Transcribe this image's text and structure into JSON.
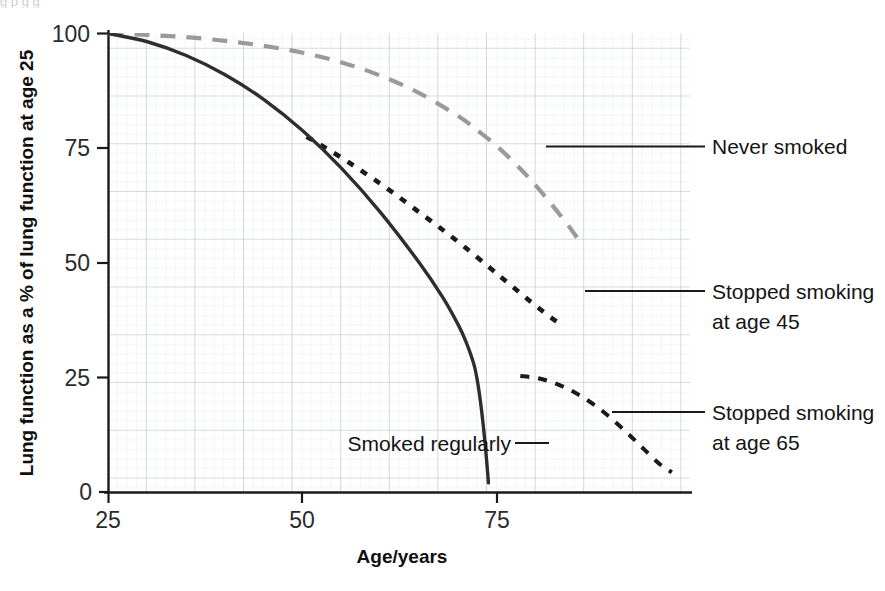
{
  "chart_data": {
    "type": "line",
    "title": "",
    "subtitle": "",
    "xlabel": "Age/years",
    "ylabel": "Lung function as a % of lung function at age 25",
    "xlim": [
      25,
      88
    ],
    "ylim": [
      0,
      100
    ],
    "xticks": [
      25,
      50,
      75
    ],
    "yticks": [
      0,
      25,
      50,
      75,
      100
    ],
    "xtick_labels": [
      "25",
      "50",
      "75"
    ],
    "ytick_labels": [
      "0",
      "25",
      "50",
      "75",
      "100"
    ],
    "grid": "fine graph paper grid, minor cells with major lines every 5 cells",
    "legend_position": "right, leader lines to curve ends",
    "series": [
      {
        "name": "Never smoked",
        "style": "dashed",
        "color": "#9a9a9a",
        "label_x": 710,
        "label_y": 152,
        "points": [
          [
            25,
            100
          ],
          [
            30,
            99.7
          ],
          [
            35,
            99.2
          ],
          [
            40,
            98.4
          ],
          [
            45,
            97.3
          ],
          [
            50,
            95.8
          ],
          [
            55,
            93.7
          ],
          [
            60,
            90.8
          ],
          [
            65,
            87.0
          ],
          [
            70,
            82.0
          ],
          [
            72,
            79.5
          ],
          [
            75,
            75.4
          ],
          [
            78,
            70.5
          ],
          [
            80,
            66.8
          ],
          [
            82,
            62.8
          ],
          [
            84,
            58.5
          ],
          [
            85,
            56.2
          ],
          [
            85.5,
            55.0
          ]
        ]
      },
      {
        "name": "Stopped smoking at age 45",
        "style": "dotted",
        "color": "#1a1a1a",
        "label_x": 710,
        "label_y": 296,
        "points": [
          [
            50.5,
            77.5
          ],
          [
            53,
            75.0
          ],
          [
            56,
            71.8
          ],
          [
            59,
            68.4
          ],
          [
            62,
            64.8
          ],
          [
            65,
            61.0
          ],
          [
            68,
            57.2
          ],
          [
            71,
            53.2
          ],
          [
            74,
            49.0
          ],
          [
            76,
            46.2
          ],
          [
            78,
            43.4
          ],
          [
            80,
            40.6
          ],
          [
            82,
            38.0
          ],
          [
            83.5,
            36.3
          ]
        ]
      },
      {
        "name": "Stopped smoking at age 65",
        "style": "dotted",
        "color": "#1a1a1a",
        "label_x": 710,
        "label_y": 417,
        "points": [
          [
            78,
            25.3
          ],
          [
            80,
            24.9
          ],
          [
            82,
            24.0
          ],
          [
            84,
            22.6
          ],
          [
            86,
            20.7
          ],
          [
            88,
            18.4
          ],
          [
            90,
            15.6
          ],
          [
            92,
            12.5
          ],
          [
            94,
            9.2
          ],
          [
            96,
            6.0
          ],
          [
            97.5,
            4.3
          ]
        ]
      },
      {
        "name": "Smoked regularly",
        "style": "solid",
        "color": "#2e2e2e",
        "label_x": 345,
        "label_y": 438,
        "points": [
          [
            25,
            100
          ],
          [
            30,
            98.2
          ],
          [
            35,
            95.2
          ],
          [
            40,
            91.0
          ],
          [
            45,
            85.6
          ],
          [
            50,
            78.8
          ],
          [
            55,
            70.6
          ],
          [
            60,
            61.0
          ],
          [
            65,
            50.0
          ],
          [
            68,
            42.5
          ],
          [
            70,
            36.5
          ],
          [
            71,
            32.8
          ],
          [
            72,
            28.0
          ],
          [
            72.5,
            24.0
          ],
          [
            73,
            18.0
          ],
          [
            73.5,
            10.0
          ],
          [
            73.9,
            2.0
          ]
        ]
      }
    ],
    "annotations": [
      {
        "text": "Never smoked",
        "target_series": "Never smoked"
      },
      {
        "text": "Stopped smoking",
        "text2": "at age 45",
        "target_series": "Stopped smoking at age 45"
      },
      {
        "text": "Stopped smoking",
        "text2": "at age 65",
        "target_series": "Stopped smoking at age 65"
      },
      {
        "text": "Smoked regularly",
        "target_series": "Smoked regularly"
      }
    ]
  },
  "axes": {
    "y_title": "Lung function as a % of lung function at age 25",
    "x_title": "Age/years",
    "y_tick_0": "0",
    "y_tick_25": "25",
    "y_tick_50": "50",
    "y_tick_75": "75",
    "y_tick_100": "100",
    "x_tick_25": "25",
    "x_tick_50": "50",
    "x_tick_75": "75"
  },
  "labels": {
    "never_smoked": "Never smoked",
    "stopped_45_line1": "Stopped smoking",
    "stopped_45_line2": "at age 45",
    "stopped_65_line1": "Stopped smoking",
    "stopped_65_line2": "at age 65",
    "smoked_regularly": "Smoked regularly"
  },
  "colors": {
    "never_smoked": "#9a9a9a",
    "stopped_smoking": "#1a1a1a",
    "smoked_regularly": "#2e2e2e",
    "grid_minor": "#dfe3e8",
    "grid_major": "#b9c0c7",
    "axis": "#1a1a1a"
  },
  "scan_artifacts": {
    "top_text": "g   p                                                  g   g",
    "bottom_text": "                                                                           "
  }
}
